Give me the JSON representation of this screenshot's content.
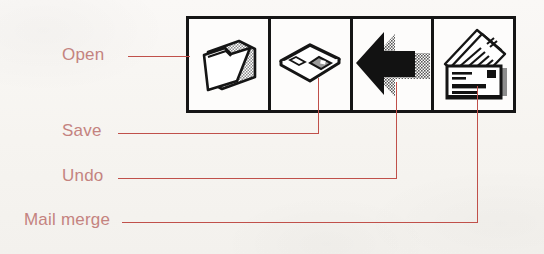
{
  "figure": {
    "kind": "annotated-toolbar-diagram",
    "background_color": "#f7f5f2",
    "callout_color": "#c0504a",
    "label_color": "#c4837f",
    "ink_color": "#151515"
  },
  "toolbar": {
    "name": "toolbar",
    "button_count": 4,
    "buttons": [
      {
        "id": "open",
        "icon": "open-folder-icon",
        "label": "Open"
      },
      {
        "id": "save",
        "icon": "floppy-disk-icon",
        "label": "Save"
      },
      {
        "id": "undo",
        "icon": "undo-arrow-icon",
        "label": "Undo"
      },
      {
        "id": "mail-merge",
        "icon": "mail-merge-icon",
        "label": "Mail merge"
      }
    ]
  },
  "callouts": [
    {
      "id": "open",
      "label": "Open",
      "target_button": "open"
    },
    {
      "id": "save",
      "label": "Save",
      "target_button": "save"
    },
    {
      "id": "undo",
      "label": "Undo",
      "target_button": "undo"
    },
    {
      "id": "mail-merge",
      "label": "Mail merge",
      "target_button": "mail-merge"
    }
  ]
}
